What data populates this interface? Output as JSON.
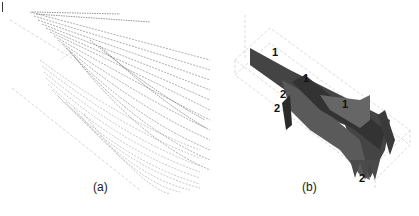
{
  "figure": {
    "panels": [
      {
        "id": "a",
        "caption": "(a)",
        "description": "Dense field of short gray vector/streak lines sweeping diagonally from upper-left to lower-right, darker in upper band"
      },
      {
        "id": "b",
        "caption": "(b)",
        "description": "3D rendered gray surfaces inside a wireframe box with numbered region labels",
        "labels": [
          "1",
          "1",
          "1",
          "2",
          "2",
          "2"
        ]
      }
    ]
  }
}
